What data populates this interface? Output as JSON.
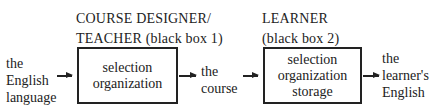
{
  "box1": {
    "heading": [
      "COURSE DESIGNER/",
      "TEACHER (black box 1)"
    ],
    "content": [
      "selection",
      "organization"
    ]
  },
  "box2": {
    "heading": [
      "LEARNER",
      "(black box 2)"
    ],
    "content": [
      "selection",
      "organization",
      "storage"
    ]
  },
  "input": [
    "the",
    "English",
    "language"
  ],
  "middle": [
    "the",
    "course"
  ],
  "output": [
    "the",
    "learner's",
    "English"
  ]
}
